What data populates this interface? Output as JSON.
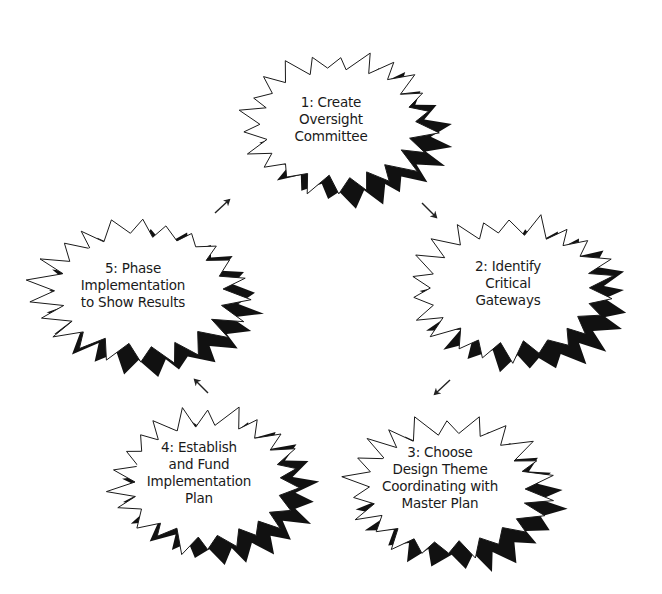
{
  "diagram": {
    "type": "cycle",
    "colors": {
      "background": "#ffffff",
      "burst_fill": "#ffffff",
      "burst_outline": "#1a1a1a",
      "shadow": "#111111",
      "text": "#1a1a1a",
      "arrow": "#222222"
    },
    "steps": [
      {
        "id": "step-1",
        "number": "1",
        "lines": [
          "1:  Create",
          "Oversight",
          "Committee"
        ],
        "cx": 338,
        "cy": 123,
        "rx": 105,
        "ry": 75,
        "label_x": 331,
        "label_y": 119
      },
      {
        "id": "step-2",
        "number": "2",
        "lines": [
          "2:  Identify",
          "Critical",
          "Gateways"
        ],
        "cx": 512,
        "cy": 288,
        "rx": 112,
        "ry": 77,
        "label_x": 508,
        "label_y": 283
      },
      {
        "id": "step-3",
        "number": "3",
        "lines": [
          "3:  Choose",
          "Design Theme",
          "Coordinating with",
          "Master Plan"
        ],
        "cx": 448,
        "cy": 488,
        "rx": 110,
        "ry": 75,
        "label_x": 440,
        "label_y": 478
      },
      {
        "id": "step-4",
        "number": "4",
        "lines": [
          "4:  Establish",
          "and Fund",
          "Implementation",
          "Plan"
        ],
        "cx": 207,
        "cy": 480,
        "rx": 103,
        "ry": 77,
        "label_x": 199,
        "label_y": 473
      },
      {
        "id": "step-5",
        "number": "5",
        "lines": [
          "5:  Phase",
          "Implementation",
          "to Show Results"
        ],
        "cx": 140,
        "cy": 290,
        "rx": 115,
        "ry": 77,
        "label_x": 133,
        "label_y": 285
      }
    ],
    "arrows": [
      {
        "from": "step-1",
        "to": "step-2",
        "x1": 422,
        "y1": 203,
        "x2": 436,
        "y2": 217
      },
      {
        "from": "step-2",
        "to": "step-3",
        "x1": 450,
        "y1": 380,
        "x2": 435,
        "y2": 394
      },
      {
        "from": "step-3",
        "to": "step-4",
        "x1": 208,
        "y1": 393,
        "x2": 195,
        "y2": 380
      },
      {
        "from": "step-4",
        "to": "step-5",
        "x1": 215,
        "y1": 213,
        "x2": 229,
        "y2": 200
      }
    ]
  }
}
